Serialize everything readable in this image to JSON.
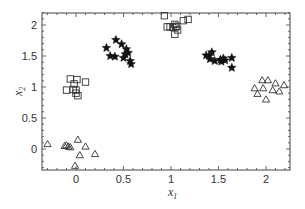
{
  "chart_data": {
    "type": "scatter",
    "title": "",
    "xlabel": "x1",
    "ylabel": "x2",
    "xlim": [
      -0.35,
      2.25
    ],
    "ylim": [
      -0.33,
      2.22
    ],
    "grid": false,
    "legend": null,
    "x_ticks": [
      "0",
      "0.5",
      "1",
      "1.5",
      "2"
    ],
    "y_ticks": [
      "0",
      "0.5",
      "1",
      "1.5",
      "2"
    ],
    "series": [
      {
        "name": "squares",
        "marker": "open-square",
        "points": [
          [
            -0.1,
            0.95
          ],
          [
            -0.06,
            1.13
          ],
          [
            -0.03,
            0.96
          ],
          [
            -0.02,
            1.05
          ],
          [
            0.0,
            0.9
          ],
          [
            0.0,
            0.95
          ],
          [
            0.01,
            1.12
          ],
          [
            0.02,
            0.86
          ],
          [
            0.1,
            1.08
          ],
          [
            0.93,
            2.15
          ],
          [
            0.96,
            1.97
          ],
          [
            0.99,
            1.97
          ],
          [
            1.02,
            1.96
          ],
          [
            1.04,
            2.01
          ],
          [
            1.04,
            1.85
          ],
          [
            1.05,
            1.97
          ],
          [
            1.07,
            1.92
          ],
          [
            1.06,
            1.98
          ],
          [
            1.13,
            2.07
          ],
          [
            1.18,
            2.09
          ]
        ]
      },
      {
        "name": "stars",
        "marker": "filled-star",
        "points": [
          [
            0.32,
            1.63
          ],
          [
            0.36,
            1.5
          ],
          [
            0.41,
            1.49
          ],
          [
            0.42,
            1.76
          ],
          [
            0.48,
            1.69
          ],
          [
            0.5,
            1.47
          ],
          [
            0.52,
            1.53
          ],
          [
            0.53,
            1.61
          ],
          [
            0.55,
            1.55
          ],
          [
            0.57,
            1.42
          ],
          [
            0.58,
            1.37
          ],
          [
            1.37,
            1.51
          ],
          [
            1.4,
            1.5
          ],
          [
            1.41,
            1.45
          ],
          [
            1.43,
            1.56
          ],
          [
            1.46,
            1.42
          ],
          [
            1.52,
            1.44
          ],
          [
            1.53,
            1.41
          ],
          [
            1.55,
            1.46
          ],
          [
            1.57,
            1.43
          ],
          [
            1.64,
            1.47
          ],
          [
            1.64,
            1.31
          ]
        ]
      },
      {
        "name": "triangles",
        "marker": "open-triangle",
        "points": [
          [
            -0.3,
            0.08
          ],
          [
            -0.12,
            0.05
          ],
          [
            -0.1,
            0.06
          ],
          [
            -0.08,
            0.04
          ],
          [
            -0.06,
            0.03
          ],
          [
            0.02,
            0.15
          ],
          [
            0.04,
            -0.1
          ],
          [
            0.1,
            0.04
          ],
          [
            0.2,
            -0.08
          ],
          [
            -0.01,
            -0.27
          ],
          [
            1.88,
            0.98
          ],
          [
            1.91,
            0.89
          ],
          [
            1.96,
            1.11
          ],
          [
            1.97,
            0.98
          ],
          [
            2.02,
            1.11
          ],
          [
            2.0,
            0.8
          ],
          [
            2.07,
            0.95
          ],
          [
            2.1,
            1.06
          ],
          [
            2.14,
            0.93
          ],
          [
            2.19,
            1.03
          ]
        ]
      }
    ]
  },
  "axes": {
    "x_label_main": "x",
    "x_label_sub": "1",
    "y_label_main": "x",
    "y_label_sub": "2"
  }
}
